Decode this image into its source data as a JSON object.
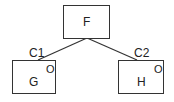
{
  "diagram": {
    "nodes": [
      {
        "id": "F",
        "label": "F",
        "marker": ""
      },
      {
        "id": "G",
        "label": "G",
        "marker": "O"
      },
      {
        "id": "H",
        "label": "H",
        "marker": "O"
      }
    ],
    "edges": [
      {
        "from": "F",
        "to": "G",
        "label": "C1"
      },
      {
        "from": "F",
        "to": "H",
        "label": "C2"
      }
    ]
  }
}
